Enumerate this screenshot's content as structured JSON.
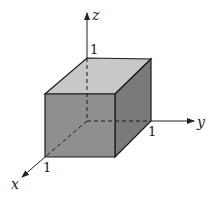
{
  "diagram": {
    "type": "3d-rectangular-box",
    "axes": {
      "x": {
        "label": "x",
        "tick": "1"
      },
      "y": {
        "label": "y",
        "tick": "1"
      },
      "z": {
        "label": "z",
        "tick": "1"
      }
    },
    "colors": {
      "top_face": "#c8c8c8",
      "front_face": "#8f8f8f",
      "side_face": "#7a7a7a",
      "edge": "#1a1a1a"
    }
  }
}
